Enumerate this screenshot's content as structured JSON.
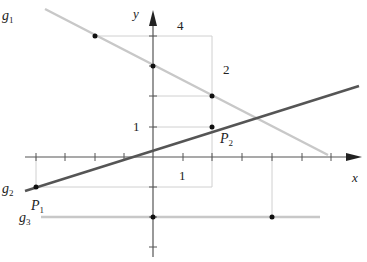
{
  "diagram": {
    "type": "coordinate-plane-lines",
    "axes": {
      "x_label": "x",
      "y_label": "y",
      "x_ticks": [
        -4,
        -3,
        -2,
        -1,
        0,
        1,
        2,
        3,
        4,
        5,
        6
      ],
      "y_ticks": [
        4,
        3,
        2,
        1,
        0,
        -1,
        -2,
        -3
      ],
      "unit_label_x": "1",
      "unit_label_y": "1"
    },
    "lines": [
      {
        "name": "g1",
        "label": "g",
        "sub": "1",
        "color": "#c8c8c8",
        "slope": -0.5,
        "intercept": 3
      },
      {
        "name": "g2",
        "label": "g",
        "sub": "2",
        "color": "#555555",
        "slope": 0.3333,
        "intercept": 0.3333
      },
      {
        "name": "g3",
        "label": "g",
        "sub": "3",
        "color": "#c8c8c8",
        "slope": 0,
        "intercept": -2
      }
    ],
    "points": [
      {
        "name": "P1",
        "label": "P",
        "sub": "1",
        "x": -4,
        "y": -1
      },
      {
        "name": "P2",
        "label": "P",
        "sub": "2",
        "x": 2,
        "y": 1
      }
    ],
    "slope_triangle_labels": {
      "g1_run": "4",
      "g1_rise": "2"
    }
  }
}
